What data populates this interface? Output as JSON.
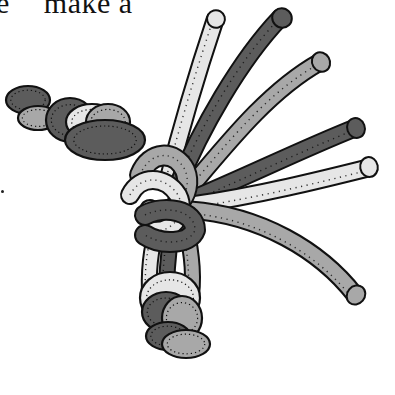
{
  "caption": {
    "prefix": "e",
    "text": "make a"
  },
  "illustration": {
    "subject": "bundle of cords tied in an overhand knot",
    "colors": {
      "light": "#e6e6e6",
      "mid": "#a8a8a8",
      "dark": "#5c5c5c",
      "outline": "#111111",
      "background": "#ffffff"
    },
    "tubes": [
      {
        "name": "cord-light-top",
        "shade": "light",
        "d": "M168,180 C178,140 195,80 215,20",
        "cap": [
          216,
          19,
          11,
          9,
          -60
        ]
      },
      {
        "name": "cord-dark-top",
        "shade": "dark",
        "d": "M178,185 C200,130 240,60 280,18",
        "cap": [
          282,
          18,
          12,
          10,
          -45
        ]
      },
      {
        "name": "cord-mid-upper",
        "shade": "mid",
        "d": "M188,190 C230,140 270,90 320,62",
        "cap": [
          321,
          62,
          11,
          10,
          -30
        ]
      },
      {
        "name": "cord-dark-right",
        "shade": "dark",
        "d": "M190,200 C250,175 300,150 355,128",
        "cap": [
          356,
          128,
          11,
          10,
          -20
        ]
      },
      {
        "name": "cord-light-right",
        "shade": "light",
        "d": "M192,205 C260,195 320,180 368,168",
        "cap": [
          369,
          167,
          11,
          10,
          -10
        ]
      },
      {
        "name": "cord-mid-long",
        "shade": "mid",
        "d": "M190,210 C260,215 320,250 355,295",
        "cap": [
          356,
          295,
          11,
          10,
          40
        ]
      }
    ],
    "left_coils": [
      {
        "name": "coil-dark-far",
        "shade": "dark",
        "cx": 28,
        "cy": 100,
        "rx": 22,
        "ry": 14
      },
      {
        "name": "coil-mid-far",
        "shade": "mid",
        "cx": 38,
        "cy": 118,
        "rx": 20,
        "ry": 12
      },
      {
        "name": "coil-dark-2",
        "shade": "dark",
        "cx": 70,
        "cy": 120,
        "rx": 24,
        "ry": 22
      },
      {
        "name": "coil-light-2",
        "shade": "light",
        "cx": 92,
        "cy": 122,
        "rx": 26,
        "ry": 18
      },
      {
        "name": "coil-mid-3",
        "shade": "mid",
        "cx": 108,
        "cy": 122,
        "rx": 22,
        "ry": 18
      },
      {
        "name": "coil-dark-3",
        "shade": "dark",
        "cx": 105,
        "cy": 140,
        "rx": 40,
        "ry": 20
      }
    ],
    "bottom_coils": [
      {
        "name": "coil-light-bottom",
        "shade": "light",
        "cx": 170,
        "cy": 298,
        "rx": 30,
        "ry": 26
      },
      {
        "name": "coil-dark-bottom",
        "shade": "dark",
        "cx": 166,
        "cy": 312,
        "rx": 24,
        "ry": 20
      },
      {
        "name": "coil-mid-bottom",
        "shade": "mid",
        "cx": 182,
        "cy": 318,
        "rx": 20,
        "ry": 22
      },
      {
        "name": "coil-dark-lower",
        "shade": "dark",
        "cx": 168,
        "cy": 336,
        "rx": 22,
        "ry": 14
      },
      {
        "name": "coil-mid-lowest",
        "shade": "mid",
        "cx": 186,
        "cy": 344,
        "rx": 24,
        "ry": 14
      }
    ]
  }
}
